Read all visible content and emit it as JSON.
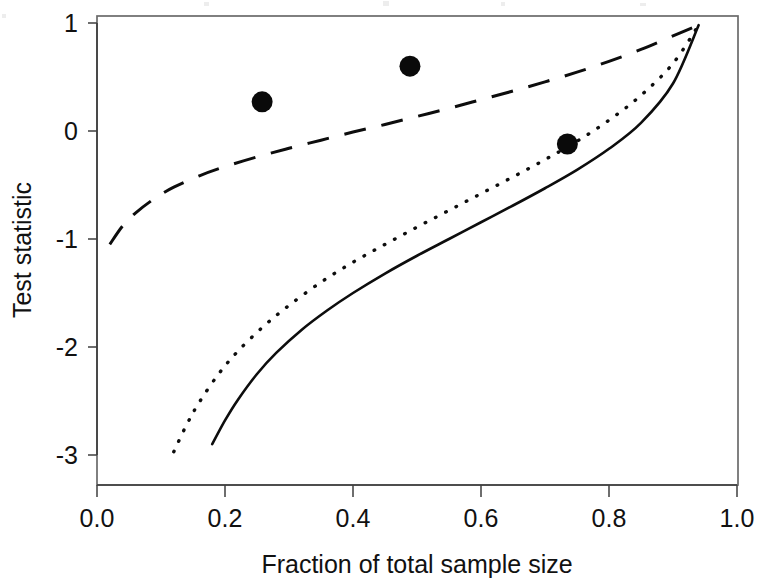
{
  "chart_data": {
    "type": "line",
    "title": "",
    "xlabel": "Fraction of total sample size",
    "ylabel": "Test statistic",
    "xlim": [
      0.0,
      1.0
    ],
    "ylim": [
      -3.15,
      1.1
    ],
    "xticks": [
      0.0,
      0.2,
      0.4,
      0.6,
      0.8,
      1.0
    ],
    "xticklabels": [
      "0.0",
      "0.2",
      "0.4",
      "0.6",
      "0.8",
      "1.0"
    ],
    "yticks": [
      1,
      0,
      -1,
      -2,
      -3
    ],
    "yticklabels": [
      "1",
      "0",
      "-1",
      "-2",
      "-3"
    ],
    "grid": false,
    "legend": null,
    "legend_position": "none",
    "series": [
      {
        "name": "dashed-boundary",
        "style": "dashed",
        "color": "#0d0d0d",
        "x": [
          0.02,
          0.04,
          0.06,
          0.09,
          0.12,
          0.16,
          0.2,
          0.25,
          0.3,
          0.35,
          0.4,
          0.45,
          0.5,
          0.55,
          0.6,
          0.65,
          0.7,
          0.75,
          0.8,
          0.85,
          0.9,
          0.94
        ],
        "y": [
          -1.05,
          -0.88,
          -0.76,
          -0.625,
          -0.52,
          -0.415,
          -0.33,
          -0.24,
          -0.16,
          -0.085,
          -0.01,
          0.06,
          0.135,
          0.21,
          0.29,
          0.37,
          0.455,
          0.545,
          0.645,
          0.755,
          0.88,
          0.98
        ]
      },
      {
        "name": "dotted-boundary",
        "style": "dotted",
        "color": "#0d0d0d",
        "x": [
          0.12,
          0.14,
          0.16,
          0.19,
          0.22,
          0.26,
          0.3,
          0.35,
          0.4,
          0.45,
          0.5,
          0.55,
          0.6,
          0.65,
          0.7,
          0.75,
          0.8,
          0.85,
          0.9,
          0.94
        ],
        "y": [
          -2.97,
          -2.72,
          -2.51,
          -2.25,
          -2.04,
          -1.81,
          -1.615,
          -1.4,
          -1.215,
          -1.05,
          -0.89,
          -0.735,
          -0.58,
          -0.425,
          -0.265,
          -0.095,
          0.1,
          0.33,
          0.625,
          0.98
        ]
      },
      {
        "name": "solid-boundary",
        "style": "solid",
        "color": "#0d0d0d",
        "x": [
          0.18,
          0.2,
          0.22,
          0.25,
          0.28,
          0.32,
          0.36,
          0.4,
          0.45,
          0.5,
          0.55,
          0.6,
          0.65,
          0.7,
          0.75,
          0.8,
          0.85,
          0.9,
          0.94
        ],
        "y": [
          -2.9,
          -2.68,
          -2.49,
          -2.25,
          -2.055,
          -1.84,
          -1.66,
          -1.5,
          -1.32,
          -1.155,
          -1.0,
          -0.845,
          -0.69,
          -0.53,
          -0.36,
          -0.165,
          0.075,
          0.44,
          0.98
        ]
      }
    ],
    "points": {
      "name": "observed-test-statistics",
      "style": "scatter",
      "marker": "filled-circle",
      "color": "#0a0a0a",
      "x": [
        0.258,
        0.489,
        0.735
      ],
      "y": [
        0.27,
        0.6,
        -0.12
      ]
    }
  },
  "axes": {
    "y_axis_title": "Test statistic",
    "x_axis_title": "Fraction of total sample size"
  }
}
